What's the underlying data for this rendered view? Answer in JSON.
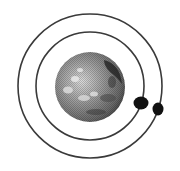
{
  "diagram": {
    "background": "#ffffff",
    "planet": {
      "label": "planet",
      "cx": 90,
      "cy": 87,
      "r": 35,
      "base_color": "#8a8a8a",
      "light_color": "#d8d8d8",
      "dark_color": "#2a2a2a"
    },
    "orbits": [
      {
        "label": "inner orbit",
        "cx": 90,
        "cy": 86,
        "r": 54,
        "stroke": "#3a3a3a",
        "stroke_width": 1.6
      },
      {
        "label": "outer orbit",
        "cx": 90,
        "cy": 86,
        "r": 72,
        "stroke": "#3a3a3a",
        "stroke_width": 1.6
      }
    ],
    "moons": [
      {
        "label": "inner moon",
        "cx": 141,
        "cy": 103,
        "rx": 7.5,
        "ry": 6.5,
        "fill": "#111111"
      },
      {
        "label": "outer moon",
        "cx": 158,
        "cy": 109,
        "rx": 5.5,
        "ry": 6.5,
        "fill": "#111111"
      }
    ]
  }
}
